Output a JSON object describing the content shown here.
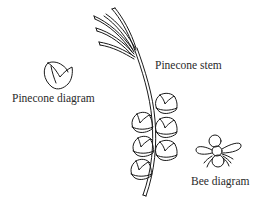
{
  "labels": {
    "pinecone_stem": "Pinecone stem",
    "pinecone_diagram": "Pinecone diagram",
    "bee_diagram": "Bee diagram"
  },
  "colors": {
    "stroke": "#1a1a1a",
    "background": "#ffffff",
    "text": "#2a2a2a"
  }
}
